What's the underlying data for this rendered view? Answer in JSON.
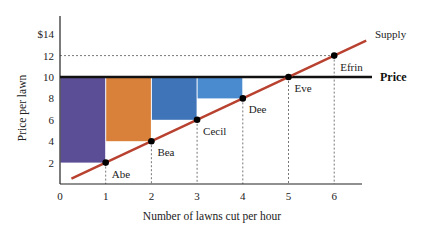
{
  "chart_data": {
    "type": "line",
    "title": "",
    "xlabel": "Number of lawns cut per hour",
    "ylabel": "Price per lawn",
    "xlim": [
      0,
      6.7
    ],
    "ylim": [
      0,
      15
    ],
    "x_ticks": [
      "0",
      "1",
      "2",
      "3",
      "4",
      "5",
      "6"
    ],
    "y_ticks": [
      "2",
      "4",
      "6",
      "8",
      "10",
      "12",
      "$14"
    ],
    "series": [
      {
        "name": "Supply",
        "color": "#b8412f",
        "points": [
          {
            "x": 0.25,
            "y": 0.5
          },
          {
            "x": 1,
            "y": 2,
            "label": "Abe"
          },
          {
            "x": 2,
            "y": 4,
            "label": "Bea"
          },
          {
            "x": 3,
            "y": 6,
            "label": "Cecil"
          },
          {
            "x": 4,
            "y": 8,
            "label": "Dee"
          },
          {
            "x": 5,
            "y": 10,
            "label": "Eve"
          },
          {
            "x": 6,
            "y": 12,
            "label": "Efrin"
          },
          {
            "x": 6.7,
            "y": 13.4
          }
        ]
      },
      {
        "name": "Price",
        "color": "#111111",
        "value": 10
      }
    ],
    "surplus_bars": [
      {
        "seller": "Abe",
        "x0": 0,
        "x1": 1,
        "cost": 2,
        "price": 10,
        "color": "#5b4e96"
      },
      {
        "seller": "Bea",
        "x0": 1,
        "x1": 2,
        "cost": 4,
        "price": 10,
        "color": "#d9803a"
      },
      {
        "seller": "Cecil",
        "x0": 2,
        "x1": 3,
        "cost": 6,
        "price": 10,
        "color": "#3f74b8"
      },
      {
        "seller": "Dee",
        "x0": 3,
        "x1": 4,
        "cost": 8,
        "price": 10,
        "color": "#4a8bd0"
      }
    ],
    "annotations": [
      "Supply",
      "Price",
      "Abe",
      "Bea",
      "Cecil",
      "Dee",
      "Eve",
      "Efrin"
    ],
    "dashed_guides": {
      "vertical_at_x": [
        1,
        2,
        3,
        4,
        5,
        6
      ],
      "horizontal_at_y": [
        12
      ]
    },
    "grid": false,
    "legend": "none"
  }
}
